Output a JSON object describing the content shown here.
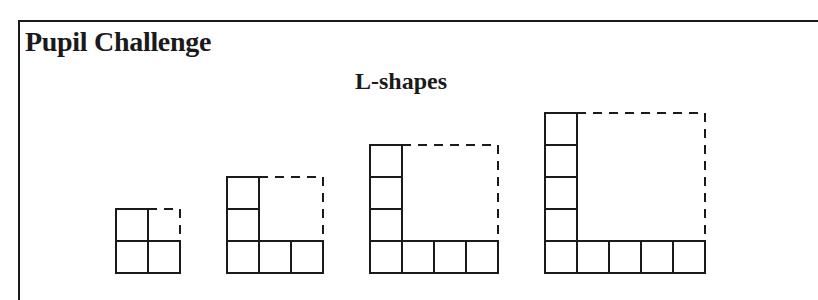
{
  "header": {
    "title": "Pupil Challenge",
    "subtitle": "L-shapes"
  },
  "figure": {
    "cell_size_px": 32,
    "line_color": "#1a1a1a",
    "shapes": [
      {
        "n": 2,
        "cells_vertical": 2,
        "cells_horizontal": 2,
        "total_cells": 3
      },
      {
        "n": 3,
        "cells_vertical": 3,
        "cells_horizontal": 3,
        "total_cells": 5
      },
      {
        "n": 4,
        "cells_vertical": 4,
        "cells_horizontal": 4,
        "total_cells": 7
      },
      {
        "n": 5,
        "cells_vertical": 5,
        "cells_horizontal": 5,
        "total_cells": 9
      }
    ]
  }
}
